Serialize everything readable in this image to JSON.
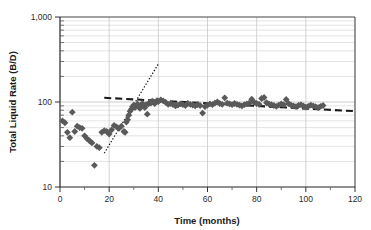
{
  "chart_data": {
    "type": "scatter",
    "title": "",
    "xlabel": "Time (months)",
    "ylabel": "Total Liquid Rate (B/D)",
    "xlim": [
      0,
      120
    ],
    "ylim": [
      10,
      1000
    ],
    "yscale": "log",
    "xscale": "linear",
    "grid": true,
    "grid_color": "#d8d8d8",
    "legend": "none",
    "xticks": [
      0,
      20,
      40,
      60,
      80,
      100,
      120
    ],
    "xtick_labels": [
      "0",
      "20",
      "40",
      "60",
      "80",
      "100",
      "120"
    ],
    "xminor_interval": 10,
    "yticks": [
      10,
      100,
      1000
    ],
    "ytick_labels": [
      "10",
      "100",
      "1,000"
    ],
    "yminor_ticks": [
      20,
      30,
      40,
      50,
      60,
      70,
      80,
      90,
      200,
      300,
      400,
      500,
      600,
      700,
      800,
      900
    ],
    "series": [
      {
        "name": "Total Liquid Rate",
        "type": "scatter",
        "marker": "diamond",
        "marker_color": "#5a5a5a",
        "marker_size": 3.4,
        "points": [
          [
            1,
            60
          ],
          [
            2,
            57
          ],
          [
            3,
            44
          ],
          [
            4,
            38
          ],
          [
            5,
            76
          ],
          [
            6,
            45
          ],
          [
            7,
            52
          ],
          [
            8,
            50
          ],
          [
            9,
            49
          ],
          [
            10,
            40
          ],
          [
            11,
            37
          ],
          [
            12,
            35
          ],
          [
            13,
            33
          ],
          [
            14,
            18
          ],
          [
            15,
            30
          ],
          [
            16,
            29
          ],
          [
            17,
            44
          ],
          [
            18,
            46
          ],
          [
            19,
            45
          ],
          [
            20,
            42
          ],
          [
            21,
            47
          ],
          [
            22,
            53
          ],
          [
            23,
            51
          ],
          [
            24,
            49
          ],
          [
            25,
            52
          ],
          [
            26,
            45
          ],
          [
            26.5,
            44
          ],
          [
            27,
            58
          ],
          [
            27.5,
            62
          ],
          [
            28,
            70
          ],
          [
            28.5,
            78
          ],
          [
            29,
            82
          ],
          [
            29.5,
            88
          ],
          [
            30,
            92
          ],
          [
            30.5,
            86
          ],
          [
            31,
            90
          ],
          [
            31.5,
            95
          ],
          [
            32,
            88
          ],
          [
            32.5,
            84
          ],
          [
            33,
            92
          ],
          [
            33.5,
            96
          ],
          [
            34,
            90
          ],
          [
            34.5,
            86
          ],
          [
            35,
            93
          ],
          [
            35.5,
            72
          ],
          [
            36,
            95
          ],
          [
            36.5,
            99
          ],
          [
            37,
            97
          ],
          [
            37.5,
            102
          ],
          [
            38,
            100
          ],
          [
            38.5,
            96
          ],
          [
            39,
            99
          ],
          [
            39.5,
            104
          ],
          [
            40,
            101
          ],
          [
            41,
            106
          ],
          [
            42,
            103
          ],
          [
            43,
            99
          ],
          [
            44,
            94
          ],
          [
            45,
            96
          ],
          [
            46,
            93
          ],
          [
            47,
            90
          ],
          [
            48,
            92
          ],
          [
            49,
            95
          ],
          [
            50,
            93
          ],
          [
            51,
            91
          ],
          [
            52,
            96
          ],
          [
            53,
            94
          ],
          [
            54,
            92
          ],
          [
            55,
            90
          ],
          [
            56,
            93
          ],
          [
            57,
            91
          ],
          [
            58,
            74
          ],
          [
            59,
            88
          ],
          [
            60,
            92
          ],
          [
            61,
            95
          ],
          [
            62,
            93
          ],
          [
            63,
            97
          ],
          [
            64,
            100
          ],
          [
            65,
            96
          ],
          [
            66,
            94
          ],
          [
            67,
            112
          ],
          [
            68,
            97
          ],
          [
            69,
            95
          ],
          [
            70,
            93
          ],
          [
            71,
            96
          ],
          [
            72,
            94
          ],
          [
            73,
            92
          ],
          [
            74,
            90
          ],
          [
            75,
            93
          ],
          [
            76,
            95
          ],
          [
            77,
            97
          ],
          [
            78,
            108
          ],
          [
            79,
            99
          ],
          [
            80,
            96
          ],
          [
            81,
            94
          ],
          [
            82,
            110
          ],
          [
            83,
            113
          ],
          [
            84,
            98
          ],
          [
            85,
            95
          ],
          [
            86,
            93
          ],
          [
            87,
            91
          ],
          [
            88,
            89
          ],
          [
            89,
            92
          ],
          [
            90,
            95
          ],
          [
            91,
            93
          ],
          [
            92,
            107
          ],
          [
            93,
            96
          ],
          [
            94,
            92
          ],
          [
            95,
            90
          ],
          [
            96,
            88
          ],
          [
            97,
            91
          ],
          [
            98,
            93
          ],
          [
            99,
            90
          ],
          [
            100,
            87
          ],
          [
            101,
            89
          ],
          [
            102,
            92
          ],
          [
            103,
            90
          ],
          [
            104,
            88
          ],
          [
            105,
            86
          ],
          [
            106,
            89
          ],
          [
            107,
            91
          ]
        ]
      }
    ],
    "annotations": [
      {
        "name": "decline-trend-line",
        "style": "dashed",
        "color": "#1a1a1a",
        "width": 2.1,
        "points": [
          [
            18,
            112
          ],
          [
            120,
            78
          ]
        ]
      },
      {
        "name": "buildup-trend-line",
        "style": "dotted",
        "color": "#1a1a1a",
        "width": 1.2,
        "points": [
          [
            18,
            25
          ],
          [
            40,
            280
          ]
        ]
      }
    ]
  }
}
